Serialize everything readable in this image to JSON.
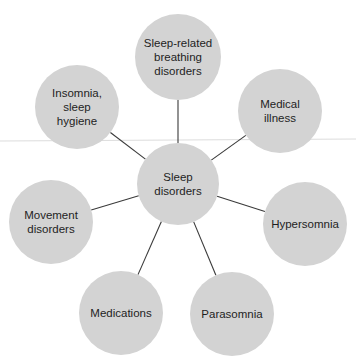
{
  "diagram": {
    "type": "hub-and-spoke",
    "center": {
      "id": "center",
      "label": "Sleep\ndisorders",
      "cx": 178,
      "cy": 184,
      "r": 41
    },
    "nodes": [
      {
        "id": "breathing",
        "label": "Sleep-related\nbreathing\ndisorders",
        "cx": 178,
        "cy": 57,
        "r": 43
      },
      {
        "id": "insomnia",
        "label": "Insomnia,\nsleep\nhygiene",
        "cx": 77,
        "cy": 107,
        "r": 42
      },
      {
        "id": "medical",
        "label": "Medical\nillness",
        "cx": 280,
        "cy": 111,
        "r": 42
      },
      {
        "id": "movement",
        "label": "Movement\ndisorders",
        "cx": 51,
        "cy": 222,
        "r": 42
      },
      {
        "id": "hypersomnia",
        "label": "Hypersomnia",
        "cx": 305,
        "cy": 224,
        "r": 42
      },
      {
        "id": "medications",
        "label": "Medications",
        "cx": 121,
        "cy": 313,
        "r": 42
      },
      {
        "id": "parasomnia",
        "label": "Parasomnia",
        "cx": 232,
        "cy": 314,
        "r": 42
      }
    ],
    "colors": {
      "node_fill": "#d3d3d3",
      "link": "#3a3a3a",
      "text": "#1e1e1e",
      "guide_line": "#dcdcdc"
    }
  }
}
